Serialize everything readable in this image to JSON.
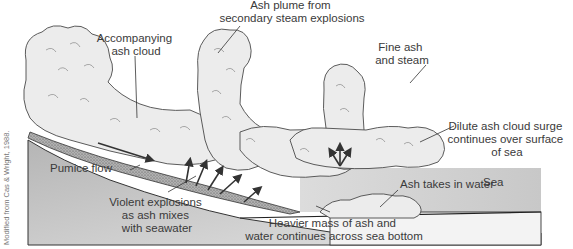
{
  "diagram": {
    "credit": "Modified from Cas & Wright, 1988.",
    "colors": {
      "background": "#ffffff",
      "land": "#c9c9c9",
      "sea": "#d4d4d4",
      "sea_floor_layer": "#f2f2f2",
      "cloud_fill": "#ececec",
      "pumice_flow": "#9a9a9a",
      "text": "#3a3a3a"
    },
    "labels": {
      "accompanying_ash_cloud": [
        "Accompanying",
        "ash cloud"
      ],
      "ash_plume": [
        "Ash plume from",
        "secondary steam explosions"
      ],
      "fine_ash": [
        "Fine ash",
        "and steam"
      ],
      "dilute_surge": [
        "Dilute ash cloud surge",
        "continues over surface",
        "of sea"
      ],
      "pumice_flow": [
        "Pumice flow"
      ],
      "violent_explosions": [
        "Violent explosions",
        "as ash mixes",
        "with seawater"
      ],
      "ash_takes_in_water": [
        "Ash takes in water"
      ],
      "sea": [
        "Sea"
      ],
      "heavier_mass": [
        "Heavier mass of ash and",
        "water continues across sea bottom"
      ]
    }
  }
}
